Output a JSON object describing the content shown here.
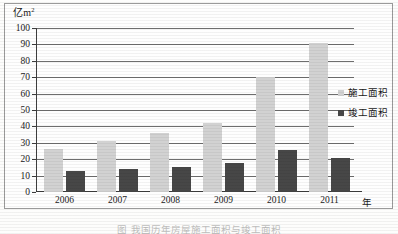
{
  "chart_data": {
    "type": "bar",
    "title": "",
    "xlabel": "年",
    "ylabel": "亿m²",
    "ylim": [
      0,
      100
    ],
    "ystep": 10,
    "grid": true,
    "legend_position": "right",
    "categories": [
      "2006",
      "2007",
      "2008",
      "2009",
      "2010",
      "2011"
    ],
    "ytick_labels": [
      "0",
      "10",
      "20",
      "30",
      "40",
      "50",
      "60",
      "70",
      "80",
      "90",
      "100"
    ],
    "series": [
      {
        "name": "施工面积",
        "color": "#d2d2d2",
        "values": [
          26,
          31,
          36,
          42,
          70,
          91
        ]
      },
      {
        "name": "竣工面积",
        "color": "#474747",
        "values": [
          13,
          14,
          15.5,
          17.5,
          25.5,
          21
        ]
      }
    ]
  },
  "axis": {
    "unit_prefix": "亿m",
    "unit_exponent": "2",
    "x_unit": "年"
  },
  "caption": {
    "text": "图    我国历年房屋施工面积与竣工面积"
  }
}
